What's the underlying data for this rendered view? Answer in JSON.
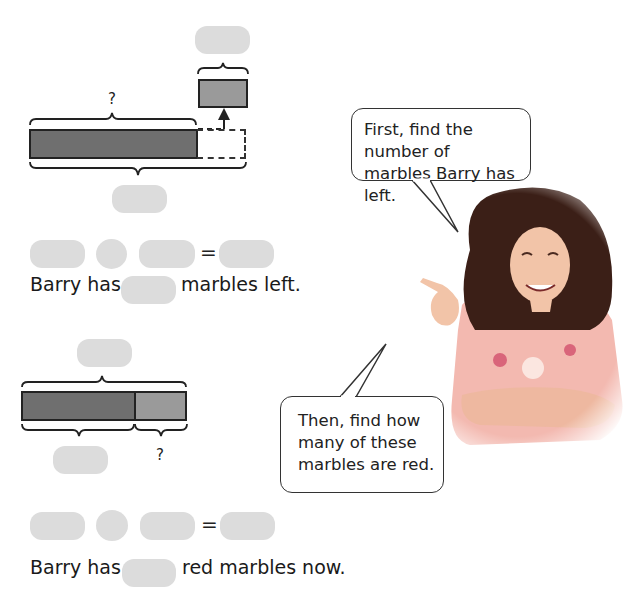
{
  "diagram1": {
    "question_mark": "?",
    "top_answer_box": "",
    "bottom_answer_box": ""
  },
  "equation1": {
    "operand1": "",
    "operator": "",
    "operand2": "",
    "equals": "=",
    "result": ""
  },
  "sentence1": {
    "prefix": "Barry has",
    "answer": "",
    "suffix": "marbles left."
  },
  "diagram2": {
    "top_answer_box": "",
    "bottom_answer_box": "",
    "question_mark": "?"
  },
  "equation2": {
    "operand1": "",
    "operator": "",
    "operand2": "",
    "equals": "=",
    "result": ""
  },
  "sentence2": {
    "prefix": "Barry has",
    "answer": "",
    "suffix": "red marbles now."
  },
  "speech_bubbles": [
    {
      "lines": [
        "First, find the number of",
        "marbles Barry has left."
      ]
    },
    {
      "lines": [
        "Then, find how",
        "many of these",
        "marbles are red."
      ]
    }
  ],
  "colors": {
    "answer_box": "#dcdcdc",
    "bar_dark": "#6f6f6f",
    "bar_light": "#9a9a9a",
    "hair": "#3b1f17",
    "shirt": "#f3b9b0",
    "skin": "#f2c4a8"
  }
}
